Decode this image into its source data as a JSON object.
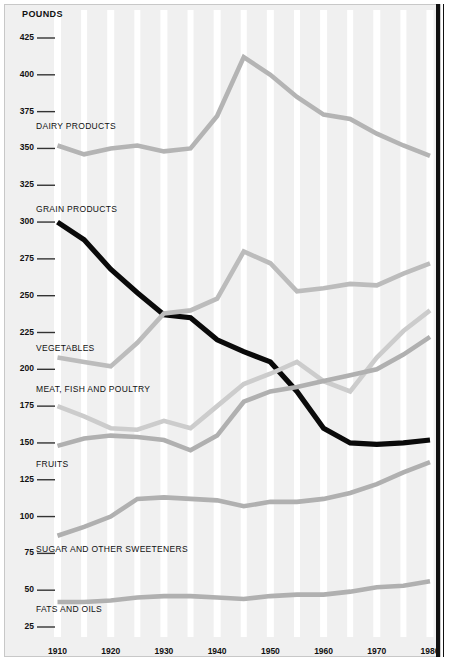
{
  "axis": {
    "y_title": "POUNDS",
    "y_ticks": [
      425,
      400,
      375,
      350,
      325,
      300,
      275,
      250,
      225,
      200,
      175,
      150,
      125,
      100,
      75,
      50,
      25
    ],
    "x_ticks": [
      1910,
      1920,
      1930,
      1940,
      1950,
      1960,
      1970,
      1980
    ]
  },
  "labels": {
    "dairy": "DAIRY PRODUCTS",
    "grain": "GRAIN PRODUCTS",
    "vegetables": "VEGETABLES",
    "meat": "MEAT, FISH AND POULTRY",
    "fruits": "FRUITS",
    "sugar": "SUGAR AND OTHER SWEETENERS",
    "fats": "FATS AND OILS"
  },
  "chart_data": {
    "type": "line",
    "title": "",
    "xlabel": "",
    "ylabel": "POUNDS",
    "xlim": [
      1910,
      1980
    ],
    "ylim": [
      25,
      425
    ],
    "ytick_step": 25,
    "grid": "vertical-decade-bands",
    "legend": "inline-series-labels",
    "background": "#f0f0f0",
    "band_color": "#ffffff",
    "x": [
      1910,
      1915,
      1920,
      1925,
      1930,
      1935,
      1940,
      1945,
      1950,
      1955,
      1960,
      1965,
      1970,
      1975,
      1980
    ],
    "series": [
      {
        "name": "DAIRY PRODUCTS",
        "color": "#b4b4b4",
        "values": [
          352,
          346,
          350,
          352,
          348,
          350,
          372,
          412,
          400,
          385,
          373,
          370,
          360,
          352,
          345
        ]
      },
      {
        "name": "GRAIN PRODUCTS",
        "color": "#0a0a0a",
        "values": [
          300,
          288,
          268,
          252,
          237,
          235,
          220,
          212,
          205,
          185,
          160,
          150,
          149,
          150,
          152
        ]
      },
      {
        "name": "VEGETABLES",
        "color": "#bcbcbc",
        "values": [
          208,
          205,
          202,
          218,
          238,
          240,
          248,
          280,
          272,
          253,
          255,
          258,
          257,
          265,
          272
        ]
      },
      {
        "name": "MEAT, FISH AND POULTRY",
        "color": "#cccccc",
        "values": [
          175,
          168,
          160,
          159,
          165,
          160,
          175,
          190,
          197,
          205,
          192,
          185,
          208,
          226,
          240
        ]
      },
      {
        "name": "FRUITS",
        "color": "#b0b0b0",
        "values": [
          148,
          153,
          155,
          154,
          152,
          145,
          155,
          178,
          185,
          188,
          192,
          196,
          200,
          210,
          222
        ]
      },
      {
        "name": "SUGAR AND OTHER SWEETENERS",
        "color": "#b0b0b0",
        "values": [
          87,
          93,
          100,
          112,
          113,
          112,
          111,
          107,
          110,
          110,
          112,
          116,
          122,
          130,
          137
        ]
      },
      {
        "name": "FATS AND OILS",
        "color": "#b0b0b0",
        "values": [
          42,
          42,
          43,
          45,
          46,
          46,
          45,
          44,
          46,
          47,
          47,
          49,
          52,
          53,
          56
        ]
      }
    ]
  }
}
